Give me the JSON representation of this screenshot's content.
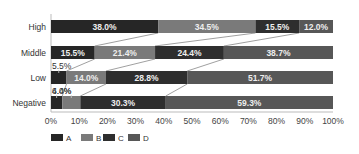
{
  "chart_data": {
    "type": "bar",
    "orientation": "horizontal",
    "stacked": true,
    "normalized": true,
    "title": "",
    "xlabel": "",
    "ylabel": "",
    "xlim": [
      0,
      100
    ],
    "categories": [
      "High",
      "Middle",
      "Low",
      "Negative"
    ],
    "series": [
      {
        "name": "A",
        "color": "#262626",
        "values": [
          38.0,
          15.5,
          5.5,
          4.0
        ]
      },
      {
        "name": "B",
        "color": "#7a7a7a",
        "values": [
          34.5,
          21.4,
          14.0,
          6.4
        ]
      },
      {
        "name": "C",
        "color": "#2e2e2e",
        "values": [
          15.5,
          24.4,
          28.8,
          30.3
        ]
      },
      {
        "name": "D",
        "color": "#575757",
        "values": [
          12.0,
          38.7,
          51.7,
          59.3
        ]
      }
    ],
    "value_labels": {
      "High": [
        "38.0%",
        "34.5%",
        "15.5%",
        "12.0%"
      ],
      "Middle": [
        "15.5%",
        "21.4%",
        "24.4%",
        "38.7%"
      ],
      "Low": [
        "5.5%",
        "14.0%",
        "28.8%",
        "51.7%"
      ],
      "Negative": [
        "4.0%",
        "6.4%",
        "30.3%",
        "59.3%"
      ]
    },
    "x_ticks": [
      "0%",
      "10%",
      "20%",
      "30%",
      "40%",
      "50%",
      "60%",
      "70%",
      "80%",
      "90%",
      "100%"
    ],
    "series_lines": true,
    "grid": false,
    "legend": {
      "position": "bottom",
      "entries": [
        "A",
        "B",
        "C",
        "D"
      ]
    }
  }
}
